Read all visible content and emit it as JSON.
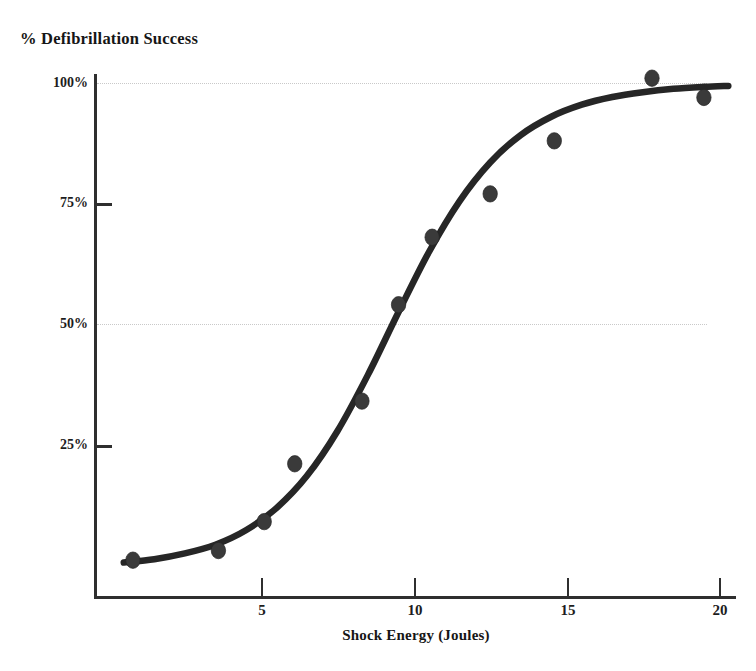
{
  "chart_data": {
    "type": "scatter",
    "title": "",
    "subtitle": "",
    "xlabel": "Shock Energy (Joules)",
    "ylabel": "% Defibrillation Success",
    "xlim": [
      0,
      20.8
    ],
    "ylim": [
      0,
      105
    ],
    "grid": "horizontal dotted gridlines at 50% and 100%",
    "legend": "none",
    "x_ticks": [
      "5",
      "10",
      "15",
      "20"
    ],
    "x_tick_values": [
      5,
      10,
      15,
      20
    ],
    "y_ticks": [
      "25%",
      "50%",
      "75%",
      "100%"
    ],
    "y_tick_values": [
      25,
      50,
      75,
      100
    ],
    "series": [
      {
        "name": "Observed defibrillation success",
        "marker": "filled circle",
        "x": [
          0.8,
          3.6,
          5.1,
          6.1,
          8.3,
          9.5,
          10.6,
          12.5,
          14.6,
          17.8,
          19.5
        ],
        "values": [
          1,
          3,
          9,
          21,
          34,
          54,
          68,
          77,
          88,
          101,
          97
        ]
      },
      {
        "name": "Fitted sigmoid curve",
        "marker": "none",
        "line": "solid thick black",
        "x": [
          0.5,
          1.5,
          2.5,
          3.5,
          4.5,
          5.5,
          6.5,
          7.5,
          8.5,
          9.5,
          10.5,
          11.5,
          12.5,
          13.5,
          14.5,
          15.5,
          16.5,
          17.5,
          18.5,
          19.5,
          20.3
        ],
        "values": [
          0.5,
          1.2,
          2.4,
          4.2,
          7.2,
          11.8,
          18.5,
          27.8,
          39.5,
          52.5,
          65.0,
          75.5,
          83.5,
          89.2,
          93.0,
          95.5,
          97.1,
          98.1,
          98.8,
          99.2,
          99.4
        ]
      }
    ],
    "colors": {
      "curve": "#262626",
      "points": "#3a3a3a",
      "axis": "#2f2f2f",
      "gridline": "#c9c9c9",
      "text": "#1a1a1a",
      "background": "#ffffff"
    }
  },
  "axes": {
    "y_title": "% Defibrillation Success",
    "x_title": "Shock Energy (Joules)",
    "y_tick_labels": [
      "100%",
      "75%",
      "50%",
      "25%"
    ],
    "x_tick_labels": [
      "5",
      "10",
      "15",
      "20"
    ]
  }
}
